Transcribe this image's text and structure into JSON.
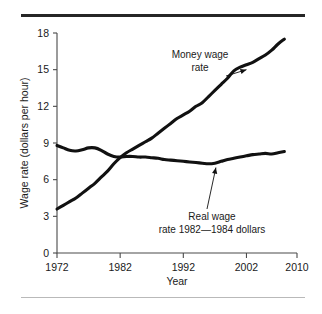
{
  "figure": {
    "background_color": "#ffffff",
    "rule_color_top": "#262626",
    "rule_color_bottom": "#b9b9b9",
    "line_color": "#111111"
  },
  "chart_data": {
    "type": "line",
    "title": "",
    "xlabel": "Year",
    "ylabel": "Wage rate (dollars per hour)",
    "xlim": [
      1972,
      2010
    ],
    "ylim": [
      0,
      18
    ],
    "xticks": [
      1972,
      1982,
      1992,
      2002,
      2010
    ],
    "xtick_labels": [
      "1972",
      "1982",
      "1992",
      "2002",
      "2010"
    ],
    "yticks": [
      0,
      3,
      6,
      9,
      12,
      15,
      18
    ],
    "ytick_labels": [
      "0",
      "3",
      "6",
      "9",
      "12",
      "15",
      "18"
    ],
    "grid": false,
    "legend": "none",
    "annotations": [
      {
        "id": "money-wage-annotation",
        "lines": [
          "Money wage",
          "rate"
        ],
        "text": "Money wage rate",
        "points_to_year": 2002,
        "points_to_value": 15.0
      },
      {
        "id": "real-wage-annotation",
        "lines": [
          "Real wage",
          "rate 1982—1984 dollars"
        ],
        "text": "Real wage rate 1982—1984 dollars",
        "points_to_year": 1997,
        "points_to_value": 7.4
      }
    ],
    "series": [
      {
        "name": "Money wage rate",
        "x": [
          1972,
          1973,
          1974,
          1975,
          1976,
          1977,
          1978,
          1979,
          1980,
          1981,
          1982,
          1983,
          1984,
          1985,
          1986,
          1987,
          1988,
          1989,
          1990,
          1991,
          1992,
          1993,
          1994,
          1995,
          1996,
          1997,
          1998,
          1999,
          2000,
          2001,
          2002,
          2003,
          2004,
          2005,
          2006,
          2007,
          2008
        ],
        "values": [
          3.6,
          3.9,
          4.2,
          4.5,
          4.9,
          5.3,
          5.7,
          6.2,
          6.7,
          7.3,
          7.8,
          8.2,
          8.5,
          8.8,
          9.1,
          9.4,
          9.8,
          10.2,
          10.6,
          11.0,
          11.3,
          11.6,
          12.0,
          12.3,
          12.8,
          13.3,
          13.8,
          14.3,
          14.9,
          15.2,
          15.4,
          15.6,
          15.9,
          16.2,
          16.6,
          17.1,
          17.5
        ]
      },
      {
        "name": "Real wage rate 1982—1984 dollars",
        "x": [
          1972,
          1973,
          1974,
          1975,
          1976,
          1977,
          1978,
          1979,
          1980,
          1981,
          1982,
          1983,
          1984,
          1985,
          1986,
          1987,
          1988,
          1989,
          1990,
          1991,
          1992,
          1993,
          1994,
          1995,
          1996,
          1997,
          1998,
          1999,
          2000,
          2001,
          2002,
          2003,
          2004,
          2005,
          2006,
          2007,
          2008
        ],
        "values": [
          8.8,
          8.6,
          8.4,
          8.35,
          8.45,
          8.6,
          8.6,
          8.4,
          8.1,
          7.9,
          7.85,
          7.9,
          7.9,
          7.85,
          7.85,
          7.8,
          7.75,
          7.65,
          7.6,
          7.55,
          7.5,
          7.45,
          7.4,
          7.35,
          7.3,
          7.35,
          7.5,
          7.65,
          7.75,
          7.85,
          7.95,
          8.05,
          8.1,
          8.15,
          8.1,
          8.2,
          8.3
        ]
      }
    ]
  }
}
